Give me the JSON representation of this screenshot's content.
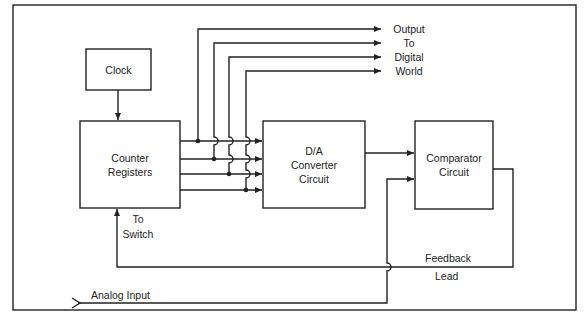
{
  "diagram": {
    "type": "block-diagram",
    "blocks": {
      "clock": {
        "label": "Clock"
      },
      "counter": {
        "line1": "Counter",
        "line2": "Registers"
      },
      "dac": {
        "line1": "D/A",
        "line2": "Converter",
        "line3": "Circuit"
      },
      "comparator": {
        "line1": "Comparator",
        "line2": "Circuit"
      }
    },
    "labels": {
      "output": [
        "Output",
        "To",
        "Digital",
        "World"
      ],
      "to_switch": [
        "To",
        "Switch"
      ],
      "feedback": "Feedback",
      "lead": "Lead",
      "analog_input": "Analog Input"
    },
    "colors": {
      "line": "#222222",
      "background": "#ffffff"
    }
  }
}
